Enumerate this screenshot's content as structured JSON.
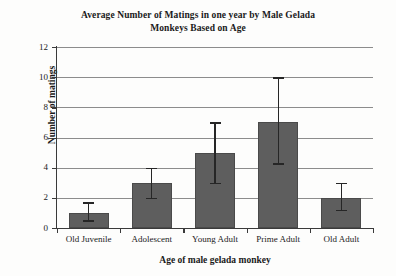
{
  "chart_data": {
    "type": "bar",
    "title": "Average Number of Matings in one year by Male Gelada Monkeys Based on Age",
    "title_lines": [
      "Average Number of Matings in one year by Male Gelada",
      "Monkeys Based on Age"
    ],
    "xlabel": "Age of male gelada monkey",
    "ylabel": "Number of matings",
    "categories": [
      "Old Juvenile",
      "Adolescent",
      "Young Adult",
      "Prime Adult",
      "Old Adult"
    ],
    "values": [
      1,
      3,
      5,
      7,
      2
    ],
    "error_low": [
      0.5,
      2.0,
      3.0,
      4.3,
      1.2
    ],
    "error_high": [
      1.7,
      4.0,
      7.0,
      10.0,
      3.0
    ],
    "ylim": [
      0,
      12
    ],
    "yticks": [
      0,
      2,
      4,
      6,
      8,
      10,
      12
    ],
    "ytick_labels": [
      "0",
      "2",
      "4",
      "6",
      "8",
      "10",
      "12"
    ],
    "grid": true,
    "grid_axis": "y",
    "legend": false,
    "bar_color": "#5e5e5e",
    "error_color": "#262626",
    "grid_color": "#8c8c8c",
    "axis_color": "#3a3a3a",
    "background": "#fdfdfc"
  }
}
